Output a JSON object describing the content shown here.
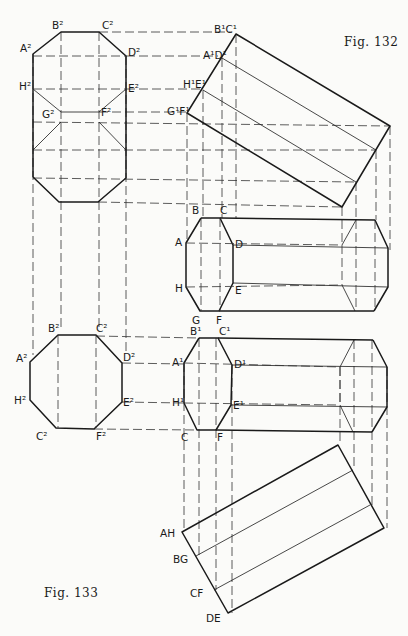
{
  "figures": {
    "fig132": "Fig. 132",
    "fig133": "Fig. 133"
  },
  "labels": {
    "top_octagon": [
      "A²",
      "B²",
      "C²",
      "D²",
      "E²",
      "F²",
      "G²",
      "H²"
    ],
    "top_rotated": [
      "B¹C¹",
      "A¹D¹",
      "H¹E¹",
      "G¹F¹"
    ],
    "mid_octagon": [
      "A",
      "B",
      "C",
      "D",
      "E",
      "F",
      "G",
      "H"
    ],
    "low_octagon": [
      "A²",
      "B²",
      "C²",
      "D²",
      "E²",
      "F²",
      "C²",
      "H²"
    ],
    "low_mid_octagon": [
      "A¹",
      "B¹",
      "C¹",
      "D¹",
      "E¹",
      "F",
      "C",
      "H¹"
    ],
    "bottom_rotated": [
      "AH",
      "BG",
      "CF",
      "DE"
    ]
  },
  "colors": {
    "ink": "#1a1a1a",
    "paper": "#fbfbf9"
  }
}
